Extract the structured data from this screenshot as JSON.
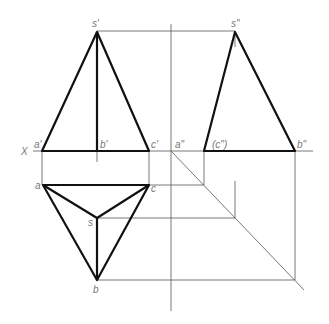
{
  "diagram": {
    "axis_label": "X",
    "labels": {
      "front": {
        "s": "s'",
        "a": "a'",
        "b": "b'",
        "c": "c'"
      },
      "side": {
        "s": "s\"",
        "a": "a\"",
        "b": "b\"",
        "c": "(c\")"
      },
      "top": {
        "s": "s",
        "a": "a",
        "b": "b",
        "c": "c"
      }
    },
    "points": {
      "front": {
        "s": [
          97,
          32
        ],
        "a": [
          42,
          151
        ],
        "b": [
          97,
          151
        ],
        "c": [
          149,
          151
        ]
      },
      "side": {
        "s": [
          235,
          32
        ],
        "c": [
          204,
          151
        ],
        "b": [
          295,
          151
        ],
        "a": [
          171,
          151
        ]
      },
      "top": {
        "a": [
          43,
          185
        ],
        "c": [
          149,
          185
        ],
        "s": [
          97,
          218
        ],
        "b": [
          97,
          280
        ]
      }
    },
    "colors": {
      "outline": "#111111",
      "construction": "#555555",
      "label": "#777777"
    }
  }
}
